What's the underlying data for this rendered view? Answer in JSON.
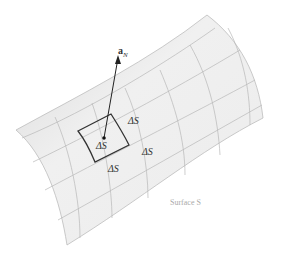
{
  "diagram": {
    "normal_vector_label": "a",
    "normal_vector_subscript": "N",
    "patch_labels": [
      "ΔS",
      "ΔS",
      "ΔS",
      "ΔS"
    ],
    "surface_label": "Surface S",
    "colors": {
      "surface_fill": "#e6e6e6",
      "grid": "#b5b5b5",
      "patch_outline": "#333333",
      "label_surface": "#aaaaaa"
    }
  }
}
